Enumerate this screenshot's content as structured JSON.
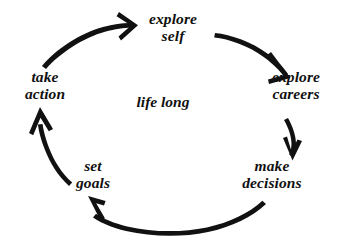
{
  "diagram": {
    "type": "cycle",
    "title_center": "life long",
    "background_color": "#ffffff",
    "ink_color": "#111111",
    "nodes": [
      {
        "id": "explore-self",
        "line1": "explore",
        "line2": "self",
        "position": "top"
      },
      {
        "id": "explore-careers",
        "line1": "explore",
        "line2": "careers",
        "position": "right"
      },
      {
        "id": "make-decisions",
        "line1": "make",
        "line2": "decisions",
        "position": "bottom-right"
      },
      {
        "id": "set-goals",
        "line1": "set",
        "line2": "goals",
        "position": "bottom-left"
      },
      {
        "id": "take-action",
        "line1": "take",
        "line2": "action",
        "position": "left"
      }
    ],
    "arrows": [
      {
        "id": "arrow-take-action-to-explore-self",
        "from": "take-action",
        "to": "explore-self",
        "direction": "clockwise"
      },
      {
        "id": "arrow-explore-self-to-explore-careers",
        "from": "explore-self",
        "to": "explore-careers",
        "direction": "clockwise"
      },
      {
        "id": "arrow-explore-careers-to-make-decisions",
        "from": "explore-careers",
        "to": "make-decisions",
        "direction": "clockwise"
      },
      {
        "id": "arrow-make-decisions-to-set-goals",
        "from": "make-decisions",
        "to": "set-goals",
        "direction": "clockwise"
      },
      {
        "id": "arrow-set-goals-to-take-action",
        "from": "set-goals",
        "to": "take-action",
        "direction": "clockwise"
      }
    ]
  }
}
